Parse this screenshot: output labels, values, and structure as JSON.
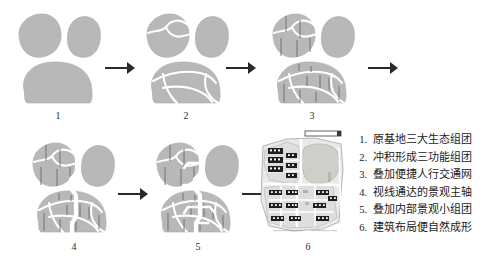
{
  "figure": {
    "type": "design-process-diagram",
    "panel_count": 6,
    "colors": {
      "blob_fill": "#b8b8b8",
      "cut_line": "#ffffff",
      "path_line": "#6a6a6a",
      "arrow": "#2a2a2a",
      "building": "#1f1f1f",
      "site_base": "#e9e9e6",
      "site_green": "#cfcfc9",
      "text": "#1b1b1b"
    }
  },
  "panels": [
    {
      "id": 1,
      "caption": "1",
      "name": "step-1-three-ecological-clusters"
    },
    {
      "id": 2,
      "caption": "2",
      "name": "step-2-three-functional-clusters"
    },
    {
      "id": 3,
      "caption": "3",
      "name": "step-3-pedestrian-network"
    },
    {
      "id": 4,
      "caption": "4",
      "name": "step-4-landscape-main-axis"
    },
    {
      "id": 5,
      "caption": "5",
      "name": "step-5-inner-landscape-clusters"
    },
    {
      "id": 6,
      "caption": "6",
      "name": "step-6-building-layout-site-plan"
    }
  ],
  "arrows": [
    {
      "name": "arrow-1-to-2",
      "row": 1
    },
    {
      "name": "arrow-2-to-3",
      "row": 1
    },
    {
      "name": "arrow-3-to-4",
      "row": 1
    },
    {
      "name": "arrow-4-to-5",
      "row": 2
    },
    {
      "name": "arrow-5-to-6",
      "row": 2
    }
  ],
  "legend": {
    "items": [
      {
        "num": "1.",
        "text": "原基地三大生态组团"
      },
      {
        "num": "2.",
        "text": "冲积形成三功能组团"
      },
      {
        "num": "3.",
        "text": "叠加便捷人行交通网"
      },
      {
        "num": "4.",
        "text": "视线通达的景观主轴"
      },
      {
        "num": "5.",
        "text": "叠加内部景观小组团"
      },
      {
        "num": "6.",
        "text": "建筑布局便自然成形"
      }
    ]
  },
  "scalebar": {
    "name": "scale-bar",
    "label": ""
  }
}
